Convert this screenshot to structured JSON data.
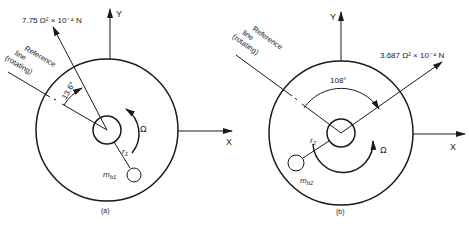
{
  "diagrams": [
    {
      "caption": "(a)",
      "force_label": "7.75 Ω² × 10⁻⁴ N",
      "angle_label": "13.6°",
      "reference_line": [
        "Reference",
        "line",
        "(rotating)"
      ],
      "omega_label": "Ω",
      "radius_label": "r",
      "radius_sub": "1",
      "mass_label": "m",
      "mass_sub": "b1",
      "x_axis_label": "X",
      "y_axis_label": "Y"
    },
    {
      "caption": "(b)",
      "force_label": "3.687 Ω² × 10⁻⁴ N",
      "angle_label": "108°",
      "reference_line": [
        "Reference",
        "line",
        "(rotating)"
      ],
      "omega_label": "Ω",
      "radius_label": "r",
      "radius_sub": "2",
      "mass_label": "m",
      "mass_sub": "b2",
      "x_axis_label": "X",
      "y_axis_label": "Y"
    }
  ]
}
